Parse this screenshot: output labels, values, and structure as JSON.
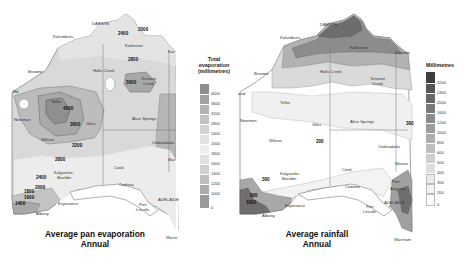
{
  "evaporation_map": {
    "caption_line1": "Average pan evaporation",
    "caption_line2": "Annual",
    "legend_title_line1": "Total",
    "legend_title_line2": "evaporation",
    "legend_title_line3": "(millimetres)",
    "legend_ticks": [
      "4000",
      "3600",
      "3200",
      "2800",
      "2400",
      "2000",
      "1800",
      "1600",
      "1400",
      "1200",
      "1000",
      "0"
    ],
    "legend_colors": [
      "#8e8e8e",
      "#a2a2a2",
      "#b2b2b2",
      "#c2c2c2",
      "#d2d2d2",
      "#e2e2e2",
      "#eeeeee",
      "#e0e0e0",
      "#cfcfcf",
      "#bdbdbd",
      "#ababab",
      "#999999"
    ],
    "places": {
      "darwin": "DARWIN",
      "kalumburu": "Kalumburu",
      "katherine": "Katherine",
      "broome": "Broome",
      "halls_creek": "Halls Creek",
      "tennant_creek_1": "Tennant",
      "tennant_creek_2": "Creek",
      "telfer": "Telfer",
      "newman": "Newman",
      "giles": "Giles",
      "alice_springs": "Alice Springs",
      "wiluna": "Wiluna",
      "oodnadatta": "Oodnadatta",
      "kalgoorlie_1": "Kalgoorlie-",
      "kalgoorlie_2": "Boulder",
      "cook": "Cook",
      "ceduna": "Ceduna",
      "esperance": "Esperance",
      "albany": "Albany",
      "port_lincoln_1": "Port",
      "port_lincoln_2": "Lincoln",
      "adelaide": "ADELAIDE",
      "warrnambool": "Warrn",
      "hedland": "Hd",
      "marree": "Mar",
      "karumba": "Kar"
    },
    "isolines": {
      "v2400_top": "2400",
      "v2000_top": "2000",
      "v2800": "2800",
      "v3600_tennant": "3600",
      "v4000": "4000",
      "v3600_giles": "3600",
      "v3200": "3200",
      "v2800_south": "2800",
      "v2400_south": "2400",
      "v2000_south": "2000",
      "v1800": "1800",
      "v1600": "1600",
      "v1400": "1400"
    }
  },
  "rainfall_map": {
    "caption_line1": "Average rainfall",
    "caption_line2": "Annual",
    "legend_title": "Millimetres",
    "legend_ticks": [
      "3200",
      "2400",
      "2000",
      "1600",
      "1200",
      "1000",
      "800",
      "600",
      "500",
      "400",
      "300",
      "200",
      "0"
    ],
    "legend_colors": [
      "#3e3e3e",
      "#555555",
      "#686868",
      "#7a7a7a",
      "#8c8c8c",
      "#9d9d9d",
      "#aeaeae",
      "#bfbfbf",
      "#cfcfcf",
      "#dedede",
      "#eaeaea",
      "#f4f4f4",
      "#ffffff"
    ],
    "places": {
      "darwin": "DARWIN",
      "kalumburu": "Kalumburu",
      "katherine": "Katherine",
      "broome": "Broome",
      "halls_creek": "Halls Creek",
      "tennant_creek_1": "Tennant",
      "tennant_creek_2": "Creek",
      "telfer": "Telfer",
      "newman": "Newman",
      "giles": "Giles",
      "alice_springs": "Alice Springs",
      "wiluna": "Wiluna",
      "oodnadatta": "Oodnadatta",
      "kalgoorlie_1": "Kalgoorlie-",
      "kalgoorlie_2": "Boulder",
      "cook": "Cook",
      "ceduna": "Ceduna",
      "marree": "Marree",
      "port_augusta_1": "Port",
      "port_augusta_2": "Augusta",
      "esperance": "Esperance",
      "albany": "Albany",
      "port_lincoln_1": "Port",
      "port_lincoln_2": "Lincoln",
      "adelaide": "ADELAIDE",
      "warrnambool": "Warrnam",
      "hedland": "and",
      "karumba": "Karumb"
    },
    "isolines": {
      "v200_centre": "200",
      "v300_kalg": "300",
      "v300_right": "300",
      "v800": "800",
      "v1000": "1000"
    }
  }
}
